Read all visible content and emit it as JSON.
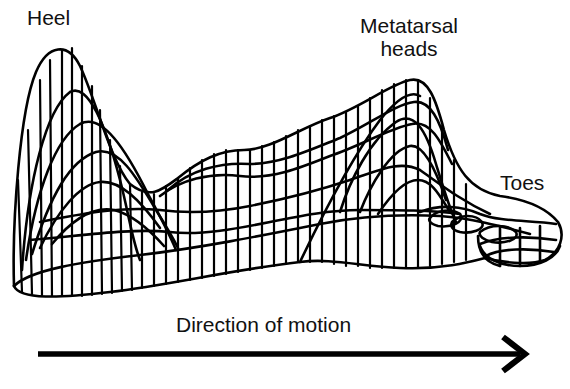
{
  "labels": {
    "heel": "Heel",
    "metatarsal_line1": "Metatarsal",
    "metatarsal_line2": "heads",
    "toes": "Toes",
    "direction": "Direction of motion"
  },
  "colors": {
    "stroke": "#000000",
    "background": "#ffffff"
  },
  "figure": {
    "peaks": [
      "Heel",
      "Metatarsal heads",
      "Toes"
    ],
    "arrow": "right"
  }
}
